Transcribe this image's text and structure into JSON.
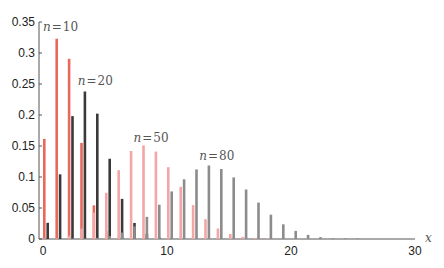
{
  "chart_data": {
    "type": "bar",
    "title": "",
    "xlabel": "x",
    "ylabel": "",
    "xlim": [
      0,
      30
    ],
    "ylim": [
      0,
      0.35
    ],
    "grid": false,
    "legend": "inline labels near each series",
    "x_ticks": [
      "0",
      "10",
      "20",
      "30"
    ],
    "y_ticks": [
      "0",
      "0.05",
      "0.1",
      "0.15",
      "0.2",
      "0.25",
      "0.3",
      "0.35"
    ],
    "x": [
      0,
      1,
      2,
      3,
      4,
      5,
      6,
      7,
      8,
      9,
      10,
      11,
      12,
      13,
      14,
      15,
      16,
      17,
      18,
      19,
      20,
      21,
      22,
      23,
      24,
      25
    ],
    "series": [
      {
        "name": "n = 10",
        "label_n": "10",
        "color": "#e8685c",
        "offset": 0,
        "values": [
          0.1615,
          0.323,
          0.2907,
          0.155,
          0.0543,
          0.013,
          0.0022,
          0.0002,
          0,
          0,
          0,
          0,
          0,
          0,
          0,
          0,
          0,
          0,
          0,
          0,
          0,
          0,
          0,
          0,
          0,
          0
        ]
      },
      {
        "name": "n = 20",
        "label_n": "20",
        "color": "#3a3a3a",
        "offset": 1,
        "values": [
          0.0261,
          0.1043,
          0.1982,
          0.2379,
          0.2022,
          0.1294,
          0.0647,
          0.0259,
          0.0084,
          0.0022,
          0.0005,
          0,
          0,
          0,
          0,
          0,
          0,
          0,
          0,
          0,
          0,
          0,
          0,
          0,
          0,
          0
        ]
      },
      {
        "name": "n = 50",
        "label_n": "50",
        "color": "#f4a5a5",
        "offset": 0,
        "values": [
          0.0001,
          0.0011,
          0.0054,
          0.0168,
          0.0428,
          0.0745,
          0.111,
          0.142,
          0.151,
          0.141,
          0.1158,
          0.0842,
          0.0547,
          0.0319,
          0.0169,
          0.0081,
          0.0035,
          0.0014,
          0.0005,
          0,
          0,
          0,
          0,
          0,
          0,
          0
        ]
      },
      {
        "name": "n = 80",
        "label_n": "80",
        "color": "#8c8c8c",
        "offset": 1,
        "values": [
          0,
          0,
          0.0001,
          0.0006,
          0.0019,
          0.0046,
          0.0104,
          0.0204,
          0.0357,
          0.0553,
          0.0767,
          0.0963,
          0.1122,
          0.1186,
          0.1129,
          0.0993,
          0.0799,
          0.0587,
          0.0392,
          0.0237,
          0.0131,
          0.0066,
          0.003,
          0.0013,
          0.0005,
          0.0002
        ]
      }
    ],
    "annotations": [
      {
        "text_var": "n",
        "text_eq": "=",
        "text_val": "10",
        "x": 0.0,
        "y": 0.335
      },
      {
        "text_var": "n",
        "text_eq": "=",
        "text_val": "20",
        "x": 2.8,
        "y": 0.248
      },
      {
        "text_var": "n",
        "text_eq": "=",
        "text_val": "50",
        "x": 7.3,
        "y": 0.157
      },
      {
        "text_var": "n",
        "text_eq": "=",
        "text_val": "80",
        "x": 12.6,
        "y": 0.128
      }
    ]
  }
}
